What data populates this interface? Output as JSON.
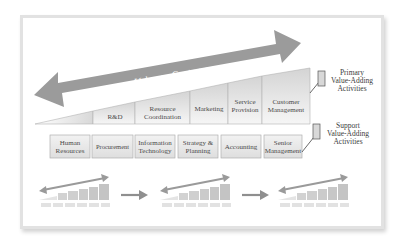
{
  "diagram": {
    "arrow": {
      "label": "Value to Customer",
      "color": "#9b9b9b",
      "direction": "bidirectional"
    },
    "primary": {
      "label_lines": [
        "Primary",
        "Value-Adding",
        "Activities"
      ],
      "boxes": [
        {
          "lines": [
            "R&D"
          ]
        },
        {
          "lines": [
            "Resource",
            "Coordination"
          ]
        },
        {
          "lines": [
            "Marketing"
          ]
        },
        {
          "lines": [
            "Service",
            "Provision"
          ]
        },
        {
          "lines": [
            "Customer",
            "Management"
          ]
        }
      ]
    },
    "support": {
      "label_lines": [
        "Support",
        "Value-Adding",
        "Activities"
      ],
      "boxes": [
        {
          "lines": [
            "Human",
            "Resources"
          ]
        },
        {
          "lines": [
            "Procurement"
          ]
        },
        {
          "lines": [
            "Information",
            "Technology"
          ]
        },
        {
          "lines": [
            "Strategy &",
            "Planning"
          ]
        },
        {
          "lines": [
            "Accounting"
          ]
        },
        {
          "lines": [
            "Senior",
            "Management"
          ]
        }
      ]
    },
    "mini_diagram_count": 3,
    "colors": {
      "frame_border": "#e2e2e2",
      "box_fill_light": "#f3f3f3",
      "box_fill_dark": "#d2d2d2",
      "box_border": "#b4b4b4",
      "text": "#4a4a4a"
    }
  }
}
